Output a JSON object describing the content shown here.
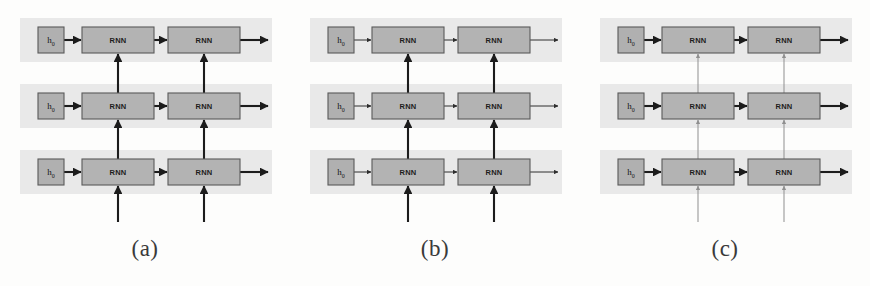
{
  "figure": {
    "background_color": "#fdfdfc",
    "band_color": "#e9e9e9",
    "box_fill_color": "#b3b3b3",
    "box_stroke_color": "#5a5a5a",
    "arrow_dark_color": "#1c1c1c",
    "arrow_faint_color": "#8f8f8f",
    "panel_count": 3,
    "rows_per_panel": 3,
    "timesteps_per_row": 2
  },
  "panels": [
    {
      "id": "a",
      "caption": "(a)",
      "horizontal_edge_weight": "thick",
      "vertical_edge_weight": "thick",
      "input_edge_weight": "thick",
      "rows": [
        {
          "index": 0,
          "init_label": "h",
          "init_subscript": "0",
          "cells": [
            {
              "label": "RNN",
              "timestep": 1
            },
            {
              "label": "RNN",
              "timestep": 2
            }
          ]
        },
        {
          "index": 1,
          "init_label": "h",
          "init_subscript": "0",
          "cells": [
            {
              "label": "RNN",
              "timestep": 1
            },
            {
              "label": "RNN",
              "timestep": 2
            }
          ]
        },
        {
          "index": 2,
          "init_label": "h",
          "init_subscript": "0",
          "cells": [
            {
              "label": "RNN",
              "timestep": 1
            },
            {
              "label": "RNN",
              "timestep": 2
            }
          ]
        }
      ]
    },
    {
      "id": "b",
      "caption": "(b)",
      "horizontal_edge_weight": "thin",
      "vertical_edge_weight": "thick",
      "input_edge_weight": "thick",
      "rows": [
        {
          "index": 0,
          "init_label": "h",
          "init_subscript": "0",
          "cells": [
            {
              "label": "RNN",
              "timestep": 1
            },
            {
              "label": "RNN",
              "timestep": 2
            }
          ]
        },
        {
          "index": 1,
          "init_label": "h",
          "init_subscript": "0",
          "cells": [
            {
              "label": "RNN",
              "timestep": 1
            },
            {
              "label": "RNN",
              "timestep": 2
            }
          ]
        },
        {
          "index": 2,
          "init_label": "h",
          "init_subscript": "0",
          "cells": [
            {
              "label": "RNN",
              "timestep": 1
            },
            {
              "label": "RNN",
              "timestep": 2
            }
          ]
        }
      ]
    },
    {
      "id": "c",
      "caption": "(c)",
      "horizontal_edge_weight": "thick",
      "vertical_edge_weight": "faint",
      "input_edge_weight": "faint",
      "rows": [
        {
          "index": 0,
          "init_label": "h",
          "init_subscript": "0",
          "cells": [
            {
              "label": "RNN",
              "timestep": 1
            },
            {
              "label": "RNN",
              "timestep": 2
            }
          ]
        },
        {
          "index": 1,
          "init_label": "h",
          "init_subscript": "0",
          "cells": [
            {
              "label": "RNN",
              "timestep": 1
            },
            {
              "label": "RNN",
              "timestep": 2
            }
          ]
        },
        {
          "index": 2,
          "init_label": "h",
          "init_subscript": "0",
          "cells": [
            {
              "label": "RNN",
              "timestep": 1
            },
            {
              "label": "RNN",
              "timestep": 2
            }
          ]
        }
      ]
    }
  ]
}
